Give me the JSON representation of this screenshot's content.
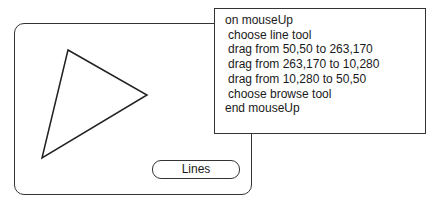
{
  "card": {
    "triangle_points": [
      [
        68,
        50
      ],
      [
        147,
        95
      ],
      [
        42,
        158
      ]
    ],
    "button_label": "Lines"
  },
  "script": {
    "lines": [
      {
        "text": "on mouseUp",
        "indent": false
      },
      {
        "text": "choose line tool",
        "indent": true
      },
      {
        "text": "drag from 50,50 to 263,170",
        "indent": true
      },
      {
        "text": "drag from 263,170 to 10,280",
        "indent": true
      },
      {
        "text": "drag from 10,280 to 50,50",
        "indent": true
      },
      {
        "text": "choose browse tool",
        "indent": true
      },
      {
        "text": "end mouseUp",
        "indent": false
      }
    ]
  }
}
